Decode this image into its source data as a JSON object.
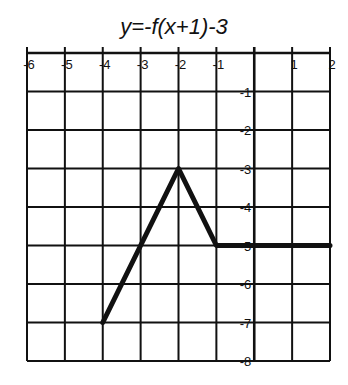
{
  "chart_data": {
    "type": "line",
    "title": "y=-f(x+1)-3",
    "xlabel": "",
    "ylabel": "",
    "xlim": [
      -6,
      2
    ],
    "ylim": [
      -8,
      0
    ],
    "grid": true,
    "x_ticks": [
      "-6",
      "-5",
      "-4",
      "-3",
      "-2",
      "-1",
      "",
      "1",
      "2"
    ],
    "y_ticks": [
      "-1",
      "-2",
      "-3",
      "-4",
      "-5",
      "-6",
      "-7",
      "-8"
    ],
    "series": [
      {
        "name": "y=-f(x+1)-3",
        "x": [
          -4,
          -2,
          -1,
          2
        ],
        "y": [
          -7,
          -3,
          -5,
          -5
        ]
      }
    ],
    "colors": {
      "line": "#111111",
      "grid": "#111111"
    }
  }
}
